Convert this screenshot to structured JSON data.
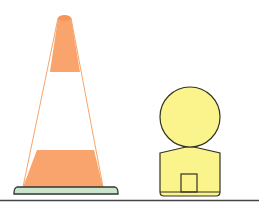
{
  "scene": {
    "title": "Traffic cone and yellow figure",
    "objects": [
      {
        "name": "traffic-cone",
        "colors": {
          "orange": "#f9a46c",
          "stripe": "#ffffff",
          "base": "#c9e5cc",
          "outline": "#333333"
        }
      },
      {
        "name": "yellow-figure",
        "colors": {
          "fill": "#fbf38c",
          "outline": "#333322"
        }
      }
    ],
    "ground_line_color": "#444444"
  }
}
